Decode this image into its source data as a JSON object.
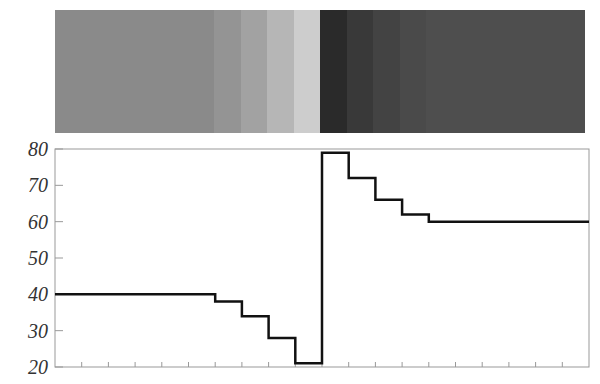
{
  "chart_data": {
    "type": "line",
    "subtype": "step",
    "title": "",
    "xlabel": "",
    "ylabel": "",
    "xlim": [
      0,
      20
    ],
    "ylim": [
      20,
      80
    ],
    "y_ticks": [
      20,
      30,
      40,
      50,
      60,
      70,
      80
    ],
    "x_ticks": [
      0,
      1,
      2,
      3,
      4,
      5,
      6,
      7,
      8,
      9,
      10,
      11,
      12,
      13,
      14,
      15,
      16,
      17,
      18,
      19,
      20
    ],
    "x_tick_labels_shown": false,
    "grid": false,
    "legend": null,
    "series": [
      {
        "name": "intensity",
        "color": "#111111",
        "segments": [
          {
            "x_start": 0,
            "x_end": 6,
            "y": 40
          },
          {
            "x_start": 6,
            "x_end": 7,
            "y": 38
          },
          {
            "x_start": 7,
            "x_end": 8,
            "y": 34
          },
          {
            "x_start": 8,
            "x_end": 9,
            "y": 28
          },
          {
            "x_start": 9,
            "x_end": 10,
            "y": 21
          },
          {
            "x_start": 10,
            "x_end": 11,
            "y": 79
          },
          {
            "x_start": 11,
            "x_end": 12,
            "y": 72
          },
          {
            "x_start": 12,
            "x_end": 13,
            "y": 66
          },
          {
            "x_start": 13,
            "x_end": 14,
            "y": 62
          },
          {
            "x_start": 14,
            "x_end": 20,
            "y": 60
          }
        ]
      }
    ],
    "annotations": [
      "Grayscale band strip above the plot: band darkness corresponds to the plotted value (higher value = darker)"
    ]
  },
  "strip": {
    "bands": [
      {
        "x_start": 0,
        "x_end": 6,
        "color": "#8a8a8a"
      },
      {
        "x_start": 6,
        "x_end": 7,
        "color": "#949494"
      },
      {
        "x_start": 7,
        "x_end": 8,
        "color": "#a2a2a2"
      },
      {
        "x_start": 8,
        "x_end": 9,
        "color": "#b6b6b6"
      },
      {
        "x_start": 9,
        "x_end": 10,
        "color": "#cdcdcd"
      },
      {
        "x_start": 10,
        "x_end": 11,
        "color": "#2a2a2a"
      },
      {
        "x_start": 11,
        "x_end": 12,
        "color": "#393939"
      },
      {
        "x_start": 12,
        "x_end": 13,
        "color": "#434343"
      },
      {
        "x_start": 13,
        "x_end": 14,
        "color": "#4a4a4a"
      },
      {
        "x_start": 14,
        "x_end": 20,
        "color": "#4e4e4e"
      }
    ]
  },
  "axis": {
    "y_labels": [
      "80",
      "70",
      "60",
      "50",
      "40",
      "30",
      "20"
    ],
    "frame_color": "#999999",
    "label_color": "#333333"
  }
}
